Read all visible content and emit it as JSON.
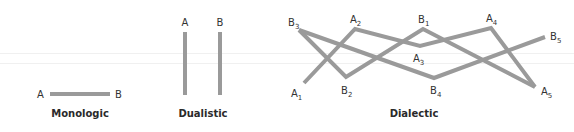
{
  "colors": {
    "line": "#9a9a9a",
    "text": "#333333",
    "background": "#ffffff"
  },
  "panels": [
    {
      "caption": "Monologic",
      "labels": {
        "a": "A",
        "b": "B"
      }
    },
    {
      "caption": "Dualistic",
      "labels": {
        "a": "A",
        "b": "B"
      }
    },
    {
      "caption": "Dialectic",
      "labels": {
        "a1": {
          "base": "A",
          "sub": "1"
        },
        "a2": {
          "base": "A",
          "sub": "2"
        },
        "a3": {
          "base": "A",
          "sub": "3"
        },
        "a4": {
          "base": "A",
          "sub": "4"
        },
        "a5": {
          "base": "A",
          "sub": "5"
        },
        "b1": {
          "base": "B",
          "sub": "1"
        },
        "b2": {
          "base": "B",
          "sub": "2"
        },
        "b3": {
          "base": "B",
          "sub": "3"
        },
        "b4": {
          "base": "B",
          "sub": "4"
        },
        "b5": {
          "base": "B",
          "sub": "5"
        }
      }
    }
  ]
}
